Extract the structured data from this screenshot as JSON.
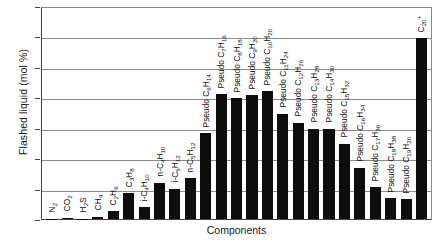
{
  "chart_data": {
    "type": "bar",
    "title": "",
    "xlabel": "Components",
    "ylabel": "Flashed liquid (mol %)",
    "ylim": [
      0,
      14
    ],
    "ytick_values": [
      14,
      12,
      10,
      8,
      6,
      4,
      2,
      0
    ],
    "grid": true,
    "legend": null,
    "bar_color": "#0d0d0d",
    "categories": [
      "N2",
      "CO2",
      "H2S",
      "CH4",
      "C2H6",
      "C3H8",
      "i-C4H10",
      "n-C4H10",
      "i-C5H12",
      "n-C5H12",
      "Pseudo C6H14",
      "Pseudo C7H16",
      "Pseudo C8H18",
      "Pseudo C9H20",
      "Pseudo C10H20",
      "Pseudo C11H24",
      "Pseudo C12H26",
      "Pseudo C13H28",
      "Pseudo C14H30",
      "Pseudo C15H32",
      "Pseudo C16H34",
      "Pseudo C17H36",
      "Pseudo C18H38",
      "Pseudo C19H20",
      "C20+"
    ],
    "category_labels_html": [
      "N<sub>2</sub>",
      "CO<sub>2</sub>",
      "H<sub>2</sub>S",
      "CH<sub>4</sub>",
      "C<sub>2</sub>H<sub>6</sub>",
      "C<sub>3</sub>H<sub>8</sub>",
      "i-C<sub>4</sub>H<sub>10</sub>",
      "n-C<sub>4</sub>H<sub>10</sub>",
      "i-C<sub>5</sub>H<sub>12</sub>",
      "n-C<sub>5</sub>H<sub>12</sub>",
      "Pseudo C<sub>6</sub>H<sub>14</sub>",
      "Pseudo C<sub>7</sub>H<sub>16</sub>",
      "Pseudo C<sub>8</sub>H<sub>18</sub>",
      "Pseudo C<sub>9</sub>H<sub>20</sub>",
      "Pseudo C<sub>10</sub>H<sub>20</sub>",
      "Pseudo C<sub>11</sub>H<sub>24</sub>",
      "Pseudo C<sub>12</sub>H<sub>26</sub>",
      "Pseudo C<sub>13</sub>H<sub>28</sub>",
      "Pseudo C<sub>14</sub>H<sub>30</sub>",
      "Pseudo C<sub>15</sub>H<sub>32</sub>",
      "Pseudo C<sub>16</sub>H<sub>34</sub>",
      "Pseudo C<sub>17</sub>H<sub>36</sub>",
      "Pseudo C<sub>18</sub>H<sub>38</sub>",
      "Pseudo C<sub>19</sub>H<sub>20</sub>",
      "C<sub>20</sub><sup>+</sup>"
    ],
    "values": [
      0.02,
      0.08,
      0.03,
      0.15,
      0.5,
      1.7,
      0.8,
      2.4,
      2.0,
      2.7,
      5.7,
      8.3,
      8.0,
      8.2,
      8.5,
      7.0,
      6.4,
      6.0,
      6.0,
      5.0,
      3.4,
      2.1,
      1.4,
      1.3,
      12.0
    ]
  }
}
